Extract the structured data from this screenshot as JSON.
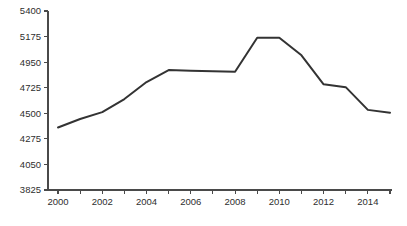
{
  "chart_data": {
    "type": "line",
    "title": "",
    "subtitle": "",
    "xlabel": "",
    "ylabel": "",
    "x": [
      2000,
      2001,
      2002,
      2003,
      2004,
      2005,
      2006,
      2007,
      2008,
      2009,
      2010,
      2011,
      2012,
      2013,
      2014,
      2015
    ],
    "values": [
      4375,
      4450,
      4510,
      4625,
      4775,
      4880,
      4875,
      4870,
      4865,
      5165,
      5165,
      5010,
      4755,
      4730,
      4530,
      4505
    ],
    "series": [
      {
        "name": "",
        "values": [
          4375,
          4450,
          4510,
          4625,
          4775,
          4880,
          4875,
          4870,
          4865,
          5165,
          5165,
          5010,
          4755,
          4730,
          4530,
          4505
        ]
      }
    ],
    "xlim": [
      2000,
      2015
    ],
    "ylim": [
      3825,
      5400
    ],
    "x_tick_values": [
      2000,
      2001,
      2002,
      2003,
      2004,
      2005,
      2006,
      2007,
      2008,
      2009,
      2010,
      2011,
      2012,
      2013,
      2014,
      2015
    ],
    "x_tick_labels": [
      "2000",
      "",
      "2002",
      "",
      "2004",
      "",
      "2006",
      "",
      "2008",
      "",
      "2010",
      "",
      "2012",
      "",
      "2014",
      ""
    ],
    "y_ticks": [
      3825,
      4050,
      4275,
      4500,
      4725,
      4950,
      5175,
      5400
    ],
    "y_tick_labels": [
      "3825",
      "4050",
      "4275",
      "4500",
      "4725",
      "4950",
      "5175",
      "5400"
    ],
    "grid": false,
    "legend": false,
    "legend_position": "none",
    "line_color": "#333333",
    "axis_color": "#4a4a4a",
    "background_color": "#ffffff",
    "annotations": []
  }
}
